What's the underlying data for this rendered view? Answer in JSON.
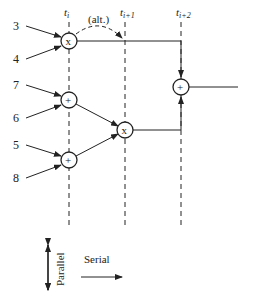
{
  "diagram": {
    "time_labels": [
      {
        "base": "t",
        "sub": "i",
        "x": 69
      },
      {
        "base": "t",
        "sub": "i+1",
        "x": 125
      },
      {
        "base": "t",
        "sub": "i+2",
        "x": 181
      }
    ],
    "alt_label": "(alt.)",
    "inputs": [
      "3",
      "4",
      "7",
      "6",
      "5",
      "8"
    ],
    "nodes": [
      {
        "id": "mult1",
        "op": "x",
        "x": 69,
        "y": 41
      },
      {
        "id": "add1",
        "op": "+",
        "x": 69,
        "y": 100
      },
      {
        "id": "add2",
        "op": "+",
        "x": 69,
        "y": 160
      },
      {
        "id": "mult2",
        "op": "x",
        "x": 125,
        "y": 130
      },
      {
        "id": "add3",
        "op": "+",
        "x": 181,
        "y": 87
      }
    ],
    "legend": {
      "parallel": "Parallel",
      "serial": "Serial"
    },
    "colors": {
      "stroke": "#222222",
      "background": "#ffffff"
    }
  }
}
